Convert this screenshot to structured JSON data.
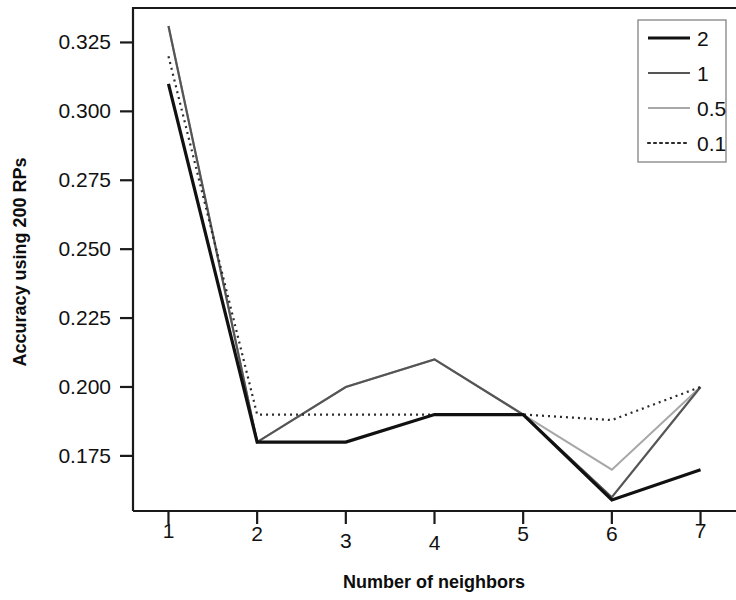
{
  "chart_data": {
    "type": "line",
    "title": "",
    "xlabel": "Number of neighbors",
    "ylabel": "Accuracy using 200 RPs",
    "x": [
      1,
      2,
      3,
      4,
      5,
      6,
      7
    ],
    "xticklabels": [
      "1",
      "2",
      "3",
      "4",
      "5",
      "6",
      "7"
    ],
    "yticks": [
      0.175,
      0.2,
      0.225,
      0.25,
      0.275,
      0.3,
      0.325
    ],
    "yticklabels": [
      "0.175",
      "0.200",
      "0.225",
      "0.250",
      "0.275",
      "0.300",
      "0.325"
    ],
    "xlim": [
      0.6,
      7.4
    ],
    "ylim": [
      0.155,
      0.3375
    ],
    "grid": false,
    "legend_position": "top-right",
    "series": [
      {
        "name": "2",
        "values": [
          0.31,
          0.18,
          0.18,
          0.19,
          0.19,
          0.159,
          0.17
        ],
        "color": "#111111",
        "width": 3.2,
        "dash": "none"
      },
      {
        "name": "1",
        "values": [
          0.331,
          0.18,
          0.2,
          0.21,
          0.19,
          0.16,
          0.2
        ],
        "color": "#555555",
        "width": 2.2,
        "dash": "none"
      },
      {
        "name": "0.5",
        "values": [
          0.331,
          0.18,
          0.2,
          0.21,
          0.19,
          0.17,
          0.2
        ],
        "color": "#a8a8a8",
        "width": 2.0,
        "dash": "none"
      },
      {
        "name": "0.1",
        "values": [
          0.32,
          0.19,
          0.19,
          0.19,
          0.19,
          0.188,
          0.2
        ],
        "color": "#2b2b2b",
        "width": 2.2,
        "dash": "2,4"
      }
    ]
  },
  "legend": {
    "entries": [
      {
        "label": "2"
      },
      {
        "label": "1"
      },
      {
        "label": "0.5"
      },
      {
        "label": "0.1"
      }
    ]
  }
}
